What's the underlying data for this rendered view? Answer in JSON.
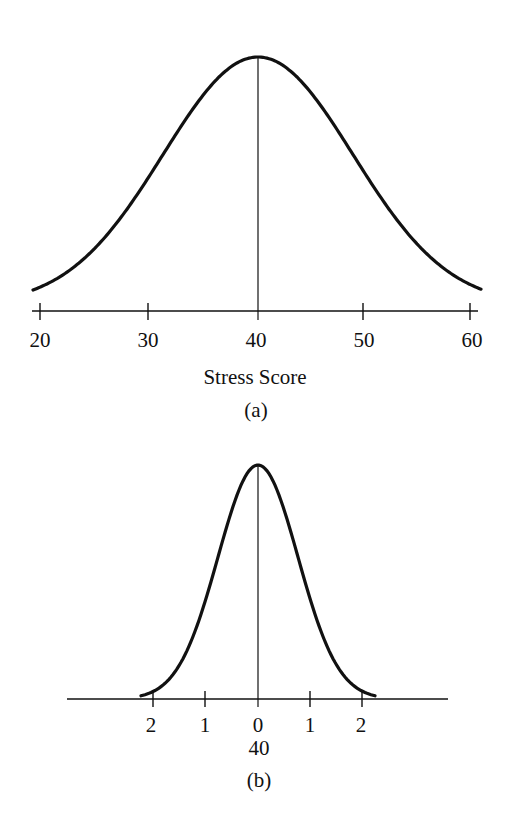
{
  "chart_data": [
    {
      "type": "line",
      "panel": "(a)",
      "title": "",
      "xlabel": "Stress Score",
      "ylabel": "",
      "x_ticks": [
        20,
        30,
        40,
        50,
        60
      ],
      "x_tick_labels": [
        "20",
        "30",
        "40",
        "50",
        "60"
      ],
      "xlim": [
        20,
        60
      ],
      "series": [
        {
          "name": "Normal distribution of stress scores",
          "mean": 40,
          "sd": 10
        }
      ],
      "annotations": [
        "vertical line at mean 40"
      ],
      "grid": false,
      "caption": "(a)"
    },
    {
      "type": "line",
      "panel": "(b)",
      "title": "",
      "xlabel": "",
      "ylabel": "",
      "x_ticks": [
        -2,
        -1,
        0,
        1,
        2
      ],
      "x_tick_labels": [
        "2",
        "1",
        "0",
        "1",
        "2"
      ],
      "x_secondary_label": "40",
      "series": [
        {
          "name": "Narrower normal distribution",
          "mean": 0,
          "sd": 1
        }
      ],
      "annotations": [
        "vertical line at 0 (score 40)"
      ],
      "grid": false,
      "caption": "(b)"
    }
  ],
  "panel_a": {
    "ticks": [
      "20",
      "30",
      "40",
      "50",
      "60"
    ],
    "xlabel": "Stress Score",
    "caption": "(a)"
  },
  "panel_b": {
    "ticks": [
      "2",
      "1",
      "0",
      "1",
      "2"
    ],
    "center_value": "40",
    "caption": "(b)"
  }
}
